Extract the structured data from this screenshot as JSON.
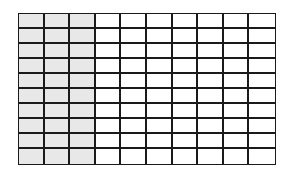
{
  "diagram": {
    "type": "fraction-grid",
    "rows": 10,
    "columns": 10,
    "shaded_columns": 3,
    "shaded_cells": 30,
    "total_cells": 100,
    "colors": {
      "shaded": "#e8e8e8",
      "unshaded": "#ffffff",
      "lines": "#1a1a1a"
    }
  }
}
